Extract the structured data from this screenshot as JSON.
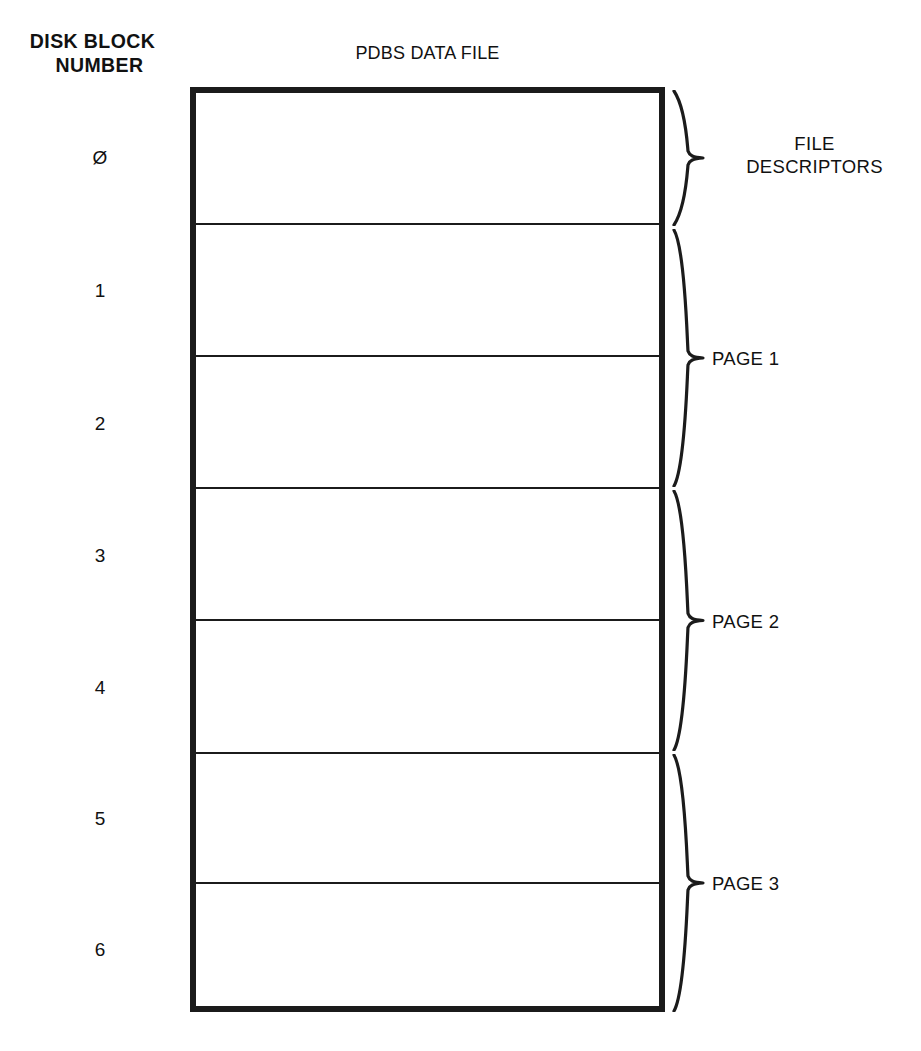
{
  "figure": {
    "left_heading_line1": "DISK BLOCK",
    "left_heading_line2": "NUMBER",
    "file_title": "PDBS DATA FILE"
  },
  "block_numbers": [
    {
      "label": "Ø",
      "top": 148
    },
    {
      "label": "1",
      "top": 281
    },
    {
      "label": "2",
      "top": 414
    },
    {
      "label": "3",
      "top": 546
    },
    {
      "label": "4",
      "top": 678
    },
    {
      "label": "5",
      "top": 809
    },
    {
      "label": "6",
      "top": 940
    }
  ],
  "dividers": [
    223,
    355,
    487,
    619,
    752,
    882
  ],
  "groups": [
    {
      "name": "file-descriptors",
      "label_line1": "FILE",
      "label_line2": "DESCRIPTORS",
      "brace_top": 90,
      "brace_height": 136,
      "label_top": 132
    },
    {
      "name": "page-1",
      "label_line1": "PAGE 1",
      "label_line2": "",
      "brace_top": 229,
      "brace_height": 258,
      "label_top": 347
    },
    {
      "name": "page-2",
      "label_line1": "PAGE 2",
      "label_line2": "",
      "brace_top": 490,
      "brace_height": 261,
      "label_top": 610
    },
    {
      "name": "page-3",
      "label_line1": "PAGE 3",
      "label_line2": "",
      "brace_top": 754,
      "brace_height": 258,
      "label_top": 872
    }
  ],
  "colors": {
    "ink": "#1b1b1b",
    "paper": "#ffffff"
  }
}
